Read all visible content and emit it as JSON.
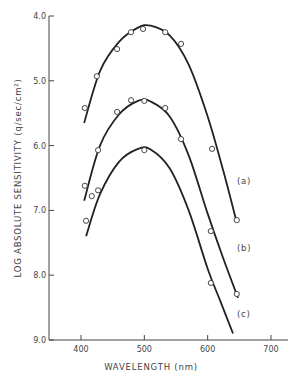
{
  "chart_data": {
    "type": "line",
    "title": "",
    "xlabel": "WAVELENGTH (nm)",
    "ylabel": "LOG ABSOLUTE SENSITIVITY (q/sec/cm²)",
    "xlim": [
      350,
      720
    ],
    "ylim": [
      9.0,
      4.0
    ],
    "y_inverted": true,
    "x_ticks": [
      400,
      500,
      600,
      700
    ],
    "x_tick_labels": [
      "400",
      "500",
      "600",
      "700"
    ],
    "y_ticks": [
      4.0,
      5.0,
      6.0,
      7.0,
      8.0,
      9.0
    ],
    "y_tick_labels": [
      "4.0",
      "5.0",
      "6.0",
      "7.0",
      "8.0",
      "9.0"
    ],
    "grid": false,
    "legend": "none (curves labeled inline)",
    "series": [
      {
        "name": "(a)",
        "points": [
          [
            406,
            5.42
          ],
          [
            425,
            4.93
          ],
          [
            457,
            4.51
          ],
          [
            479,
            4.25
          ],
          [
            498,
            4.2
          ],
          [
            533,
            4.25
          ],
          [
            558,
            4.43
          ],
          [
            607,
            6.05
          ],
          [
            646,
            7.15
          ]
        ],
        "fit": [
          [
            405,
            5.65
          ],
          [
            430,
            4.85
          ],
          [
            460,
            4.4
          ],
          [
            490,
            4.18
          ],
          [
            510,
            4.15
          ],
          [
            540,
            4.3
          ],
          [
            570,
            4.75
          ],
          [
            600,
            5.55
          ],
          [
            625,
            6.4
          ],
          [
            645,
            7.15
          ]
        ]
      },
      {
        "name": "(b)",
        "points": [
          [
            406,
            6.62
          ],
          [
            417,
            6.78
          ],
          [
            427,
            6.69
          ],
          [
            427,
            6.07
          ],
          [
            457,
            5.48
          ],
          [
            479,
            5.3
          ],
          [
            500,
            5.31
          ],
          [
            533,
            5.42
          ],
          [
            558,
            5.9
          ],
          [
            605,
            7.32
          ],
          [
            646,
            8.29
          ]
        ],
        "fit": [
          [
            405,
            6.85
          ],
          [
            430,
            6.0
          ],
          [
            460,
            5.52
          ],
          [
            490,
            5.31
          ],
          [
            510,
            5.32
          ],
          [
            540,
            5.55
          ],
          [
            570,
            6.15
          ],
          [
            600,
            7.05
          ],
          [
            625,
            7.75
          ],
          [
            648,
            8.35
          ]
        ]
      },
      {
        "name": "(c)",
        "points": [
          [
            408,
            7.16
          ],
          [
            500,
            6.07
          ],
          [
            605,
            8.12
          ]
        ],
        "fit": [
          [
            408,
            7.4
          ],
          [
            430,
            6.75
          ],
          [
            460,
            6.25
          ],
          [
            490,
            6.05
          ],
          [
            510,
            6.06
          ],
          [
            540,
            6.35
          ],
          [
            570,
            7.0
          ],
          [
            600,
            7.9
          ],
          [
            620,
            8.4
          ],
          [
            640,
            8.9
          ]
        ]
      }
    ]
  },
  "labels": {
    "a": "(a)",
    "b": "(b)",
    "c": "(c)",
    "y_axis_title": "LOG ABSOLUTE SENSITIVITY (q/sec/cm²)",
    "x_axis_title": "WAVELENGTH (nm)"
  }
}
